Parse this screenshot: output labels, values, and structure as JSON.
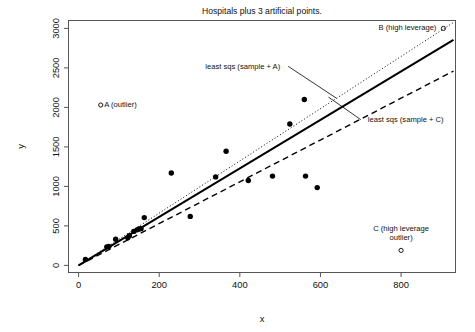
{
  "chart_data": {
    "type": "scatter",
    "title": "Hospitals plus 3 artificial points.",
    "xlabel": "x",
    "ylabel": "y",
    "xlim": [
      -25,
      935
    ],
    "ylim": [
      -90,
      3100
    ],
    "xticks": [
      0,
      200,
      400,
      600,
      800
    ],
    "yticks": [
      0,
      500,
      1000,
      1500,
      2000,
      2500,
      3000
    ],
    "xticklabels": [
      "0",
      "200",
      "400",
      "600",
      "800"
    ],
    "yticklabels": [
      "0",
      "500",
      "1000",
      "1500",
      "2000",
      "2500",
      "3000"
    ],
    "grid": false,
    "legend": "none",
    "series": [
      {
        "name": "hospitals sample",
        "marker": "filled-circle",
        "color": "#000000",
        "points": [
          [
            17,
            75
          ],
          [
            70,
            235
          ],
          [
            75,
            240
          ],
          [
            92,
            330
          ],
          [
            122,
            350
          ],
          [
            126,
            375
          ],
          [
            137,
            430
          ],
          [
            145,
            450
          ],
          [
            150,
            460
          ],
          [
            155,
            465
          ],
          [
            163,
            605
          ],
          [
            230,
            1170
          ],
          [
            277,
            620
          ],
          [
            340,
            1120
          ],
          [
            366,
            1445
          ],
          [
            421,
            1075
          ],
          [
            481,
            1130
          ],
          [
            524,
            1790
          ],
          [
            560,
            2100
          ],
          [
            563,
            1130
          ],
          [
            592,
            985
          ]
        ]
      },
      {
        "name": "artificial points",
        "marker": "open-circle",
        "color": "#000000",
        "points": [
          [
            55,
            2030
          ],
          [
            905,
            3000
          ],
          [
            800,
            190
          ]
        ]
      }
    ],
    "lines": [
      {
        "name": "least sqs (sample + A)",
        "style": "dotted",
        "width": 1,
        "color": "#000000",
        "from": [
          0,
          0
        ],
        "to": [
          930,
          3075
        ]
      },
      {
        "name": "least sqs (sample)",
        "style": "solid",
        "width": 2,
        "color": "#000000",
        "from": [
          0,
          0
        ],
        "to": [
          930,
          2855
        ]
      },
      {
        "name": "least sqs (sample + C)",
        "style": "dashed",
        "width": 1.4,
        "color": "#000000",
        "from": [
          0,
          0
        ],
        "to": [
          930,
          2460
        ]
      }
    ],
    "annotations": [
      {
        "id": "point-a",
        "text": "A (outlier)",
        "at": [
          55,
          2030
        ],
        "anchor": "left-of-point"
      },
      {
        "id": "point-b",
        "text": "B (high leverage)",
        "at": [
          905,
          3000
        ],
        "anchor": "right-of-point"
      },
      {
        "id": "point-c",
        "text_line1": "C (high leverage",
        "text_line2": "outlier)",
        "at": [
          800,
          190
        ],
        "anchor": "above-point"
      },
      {
        "id": "line-a-label",
        "text": "least sqs (sample + A)",
        "leader_from": [
          520,
          2520
        ],
        "leader_to": [
          640,
          2115
        ]
      },
      {
        "id": "line-c-label",
        "text": "least sqs (sample + C)",
        "leader_from": [
          700,
          1845
        ],
        "leader_to": [
          620,
          2130
        ]
      }
    ]
  },
  "figure": {
    "title": "Hospitals plus 3 artificial points.",
    "axis_x_label": "x",
    "axis_y_label": "y",
    "tick_labels_x": [
      "0",
      "200",
      "400",
      "600",
      "800"
    ],
    "tick_labels_y": [
      "0",
      "500",
      "1000",
      "1500",
      "2000",
      "2500",
      "3000"
    ],
    "annotation_a": "A (outlier)",
    "annotation_b": "B (high leverage)",
    "annotation_c_line1": "C (high leverage",
    "annotation_c_line2": "outlier)",
    "annotation_fit_a": "least sqs (sample + A)",
    "annotation_fit_c": "least sqs (sample + C)",
    "colors": {
      "ink": "#000000",
      "frame": "#555555",
      "background": "#ffffff"
    }
  }
}
